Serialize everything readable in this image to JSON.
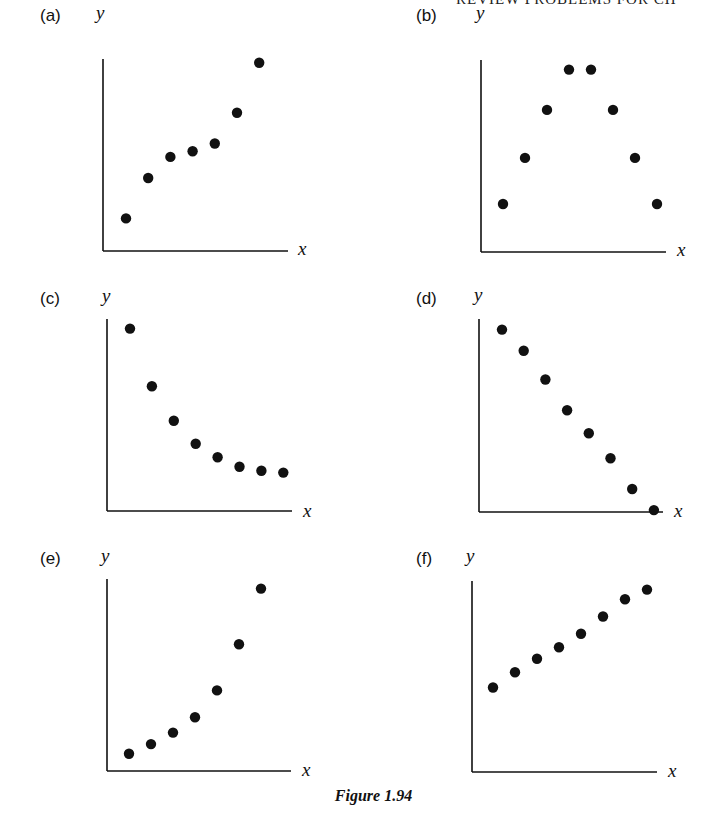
{
  "page": {
    "running_head": "REVIEW PROBLEMS FOR CH",
    "caption": "Figure 1.94"
  },
  "panels": [
    {
      "label": "(a)",
      "xlabel": "x",
      "ylabel": "y"
    },
    {
      "label": "(b)",
      "xlabel": "x",
      "ylabel": "y"
    },
    {
      "label": "(c)",
      "xlabel": "x",
      "ylabel": "y"
    },
    {
      "label": "(d)",
      "xlabel": "x",
      "ylabel": "y"
    },
    {
      "label": "(e)",
      "xlabel": "x",
      "ylabel": "y"
    },
    {
      "label": "(f)",
      "xlabel": "x",
      "ylabel": "y"
    }
  ],
  "chart_data": [
    {
      "type": "scatter",
      "title": "(a)",
      "xlabel": "x",
      "ylabel": "y",
      "x": [
        1,
        2,
        3,
        4,
        5,
        6,
        7
      ],
      "y": [
        1.7,
        3.8,
        4.9,
        5.2,
        5.6,
        7.2,
        9.8
      ],
      "xlim": [
        0,
        8.4
      ],
      "ylim": [
        0,
        10
      ],
      "grid": false,
      "ticks": false,
      "description": "increasing, concave then convex (rises, levels off, then rises sharply)"
    },
    {
      "type": "scatter",
      "title": "(b)",
      "xlabel": "x",
      "ylabel": "y",
      "x": [
        1,
        2,
        3,
        4,
        5,
        6,
        7,
        8
      ],
      "y": [
        2.5,
        4.9,
        7.4,
        9.5,
        9.5,
        7.4,
        4.9,
        2.5
      ],
      "xlim": [
        0,
        8.4
      ],
      "ylim": [
        0,
        10
      ],
      "grid": false,
      "ticks": false,
      "description": "symmetric rise then fall (inverted parabola)"
    },
    {
      "type": "scatter",
      "title": "(c)",
      "xlabel": "x",
      "ylabel": "y",
      "x": [
        1,
        2,
        3,
        4,
        5,
        6,
        7,
        8
      ],
      "y": [
        9.5,
        6.5,
        4.7,
        3.5,
        2.8,
        2.3,
        2.1,
        2.0
      ],
      "xlim": [
        0,
        8.4
      ],
      "ylim": [
        0,
        10
      ],
      "grid": false,
      "ticks": false,
      "description": "decreasing, concave up (exponential decay toward asymptote)"
    },
    {
      "type": "scatter",
      "title": "(d)",
      "xlabel": "x",
      "ylabel": "y",
      "x": [
        1,
        2,
        3,
        4,
        5,
        6,
        7,
        8
      ],
      "y": [
        9.5,
        8.4,
        6.9,
        5.3,
        4.1,
        2.8,
        1.2,
        0.1
      ],
      "xlim": [
        0,
        8.4
      ],
      "ylim": [
        0,
        10
      ],
      "grid": false,
      "ticks": false,
      "description": "decreasing, roughly linear"
    },
    {
      "type": "scatter",
      "title": "(e)",
      "xlabel": "x",
      "ylabel": "y",
      "x": [
        1,
        2,
        3,
        4,
        5,
        6,
        7
      ],
      "y": [
        0.9,
        1.4,
        2.0,
        2.8,
        4.2,
        6.6,
        9.5
      ],
      "xlim": [
        0,
        8.4
      ],
      "ylim": [
        0,
        10
      ],
      "grid": false,
      "ticks": false,
      "description": "increasing, concave up (exponential growth)"
    },
    {
      "type": "scatter",
      "title": "(f)",
      "xlabel": "x",
      "ylabel": "y",
      "x": [
        1,
        2,
        3,
        4,
        5,
        6,
        7,
        8
      ],
      "y": [
        4.4,
        5.2,
        5.9,
        6.5,
        7.2,
        8.1,
        9.0,
        9.5
      ],
      "xlim": [
        0,
        8.4
      ],
      "ylim": [
        0,
        10
      ],
      "grid": false,
      "ticks": false,
      "description": "increasing, roughly linear"
    }
  ],
  "layout": {
    "panels_px": [
      {
        "axis_x": 103,
        "axis_top": 59,
        "axis_bottom": 251,
        "axis_right": 288,
        "x0": 126,
        "dx": 22.2
      },
      {
        "axis_x": 481,
        "axis_top": 60,
        "axis_bottom": 252,
        "axis_right": 666,
        "x0": 503,
        "dx": 22.0
      },
      {
        "axis_x": 107,
        "axis_top": 319,
        "axis_bottom": 511,
        "axis_right": 292,
        "x0": 130,
        "dx": 21.9
      },
      {
        "axis_x": 479,
        "axis_top": 319,
        "axis_bottom": 512,
        "axis_right": 663,
        "x0": 502,
        "dx": 21.7
      },
      {
        "axis_x": 107,
        "axis_top": 579,
        "axis_bottom": 771,
        "axis_right": 291,
        "x0": 129,
        "dx": 22.0
      },
      {
        "axis_x": 472,
        "axis_top": 581,
        "axis_bottom": 772,
        "axis_right": 657,
        "x0": 493,
        "dx": 22.0
      }
    ],
    "label_px": [
      {
        "label_x": 40,
        "label_y": 6,
        "ylabel_x": 96,
        "ylabel_y": 2,
        "xlabel_x": 298,
        "xlabel_y": 238
      },
      {
        "label_x": 416,
        "label_y": 6,
        "ylabel_x": 476,
        "ylabel_y": 2,
        "xlabel_x": 677,
        "xlabel_y": 239
      },
      {
        "label_x": 40,
        "label_y": 289,
        "ylabel_x": 102,
        "ylabel_y": 285,
        "xlabel_x": 303,
        "xlabel_y": 500
      },
      {
        "label_x": 416,
        "label_y": 289,
        "ylabel_x": 474,
        "ylabel_y": 284,
        "xlabel_x": 674,
        "xlabel_y": 500
      },
      {
        "label_x": 40,
        "label_y": 549,
        "ylabel_x": 101,
        "ylabel_y": 545,
        "xlabel_x": 302,
        "xlabel_y": 759
      },
      {
        "label_x": 416,
        "label_y": 549,
        "ylabel_x": 466,
        "ylabel_y": 545,
        "xlabel_x": 668,
        "xlabel_y": 760
      }
    ],
    "dot_radius": 5.2,
    "ink_color": "#111111",
    "y_scale_px": 192
  }
}
